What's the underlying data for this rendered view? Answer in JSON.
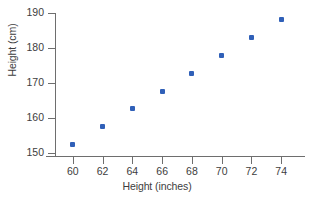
{
  "chart_data": {
    "type": "scatter",
    "title": "",
    "xlabel": "Height (inches)",
    "ylabel": "Height (cm)",
    "xlim": [
      58.8,
      75.6
    ],
    "ylim": [
      149.0,
      190.0
    ],
    "xticks": [
      60,
      62,
      64,
      66,
      68,
      70,
      72,
      74
    ],
    "yticks": [
      150,
      160,
      170,
      180,
      190
    ],
    "xtick_labels": [
      "60",
      "62",
      "64",
      "66",
      "68",
      "70",
      "72",
      "74"
    ],
    "ytick_labels": [
      "150",
      "160",
      "170",
      "180",
      "190"
    ],
    "grid": false,
    "legend": null,
    "marker_color": "#3060b8",
    "axis_color": "#6e6e6e",
    "series": [
      {
        "name": "height conversion",
        "x": [
          60,
          62,
          64,
          66,
          68,
          70,
          72,
          74
        ],
        "y": [
          152.4,
          157.5,
          162.6,
          167.6,
          172.7,
          177.8,
          182.9,
          188.0
        ]
      }
    ],
    "points": [
      {
        "x": 60,
        "y": 152.4
      },
      {
        "x": 62,
        "y": 157.5
      },
      {
        "x": 64,
        "y": 162.6
      },
      {
        "x": 66,
        "y": 167.6
      },
      {
        "x": 68,
        "y": 172.7
      },
      {
        "x": 70,
        "y": 177.8
      },
      {
        "x": 72,
        "y": 182.9
      },
      {
        "x": 74,
        "y": 188.0
      }
    ]
  }
}
